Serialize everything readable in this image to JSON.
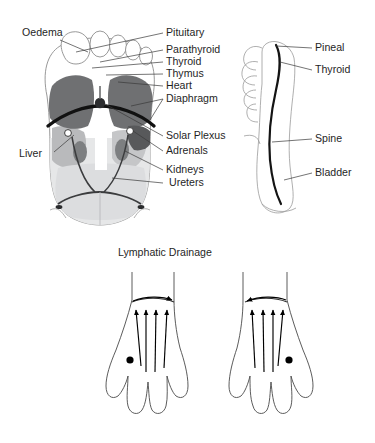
{
  "figure": {
    "title_lymphatic": "Lymphatic Drainage",
    "plantar_view": {
      "name": "plantar-foot-diagram",
      "labels_left": [
        {
          "id": "oedema",
          "text": "Oedema",
          "x": 22,
          "y": 36
        },
        {
          "id": "liver",
          "text": "Liver",
          "x": 19,
          "y": 157
        }
      ],
      "labels_right": [
        {
          "id": "pituitary",
          "text": "Pituitary",
          "x": 166,
          "y": 36
        },
        {
          "id": "parathyroid",
          "text": "Parathyroid",
          "x": 166,
          "y": 53
        },
        {
          "id": "thyroid",
          "text": "Thyroid",
          "x": 166,
          "y": 65
        },
        {
          "id": "thymus",
          "text": "Thymus",
          "x": 166,
          "y": 77
        },
        {
          "id": "heart",
          "text": "Heart",
          "x": 166,
          "y": 89
        },
        {
          "id": "diaphragm",
          "text": "Diaphragm",
          "x": 166,
          "y": 102
        },
        {
          "id": "solar-plexus",
          "text": "Solar Plexus",
          "x": 166,
          "y": 139
        },
        {
          "id": "adrenals",
          "text": "Adrenals",
          "x": 166,
          "y": 154
        },
        {
          "id": "kidneys",
          "text": "Kidneys",
          "x": 166,
          "y": 173
        },
        {
          "id": "ureters",
          "text": "Ureters",
          "x": 169,
          "y": 186
        }
      ]
    },
    "medial_view": {
      "name": "medial-foot-diagram",
      "labels": [
        {
          "id": "pineal",
          "text": "Pineal",
          "x": 315,
          "y": 51
        },
        {
          "id": "thyroid-medial",
          "text": "Thyroid",
          "x": 315,
          "y": 73
        },
        {
          "id": "spine",
          "text": "Spine",
          "x": 315,
          "y": 142
        },
        {
          "id": "bladder",
          "text": "Bladder",
          "x": 315,
          "y": 176
        }
      ]
    },
    "lymphatic_view": {
      "name": "lymphatic-drainage-diagram",
      "title_x": 118,
      "title_y": 256,
      "feet": [
        {
          "id": "left-foot",
          "side": "left"
        },
        {
          "id": "right-foot",
          "side": "right"
        }
      ],
      "arrow_count_per_foot": 4
    },
    "colors": {
      "lung_dark": "#6f7072",
      "organ_mid": "#a9abad",
      "organ_light": "#cdcfd0",
      "organ_faint": "#e2e3e4",
      "diaphragm_line": "#111111",
      "outline": "#8d8d8d",
      "text": "#1f1f1f",
      "background": "#ffffff"
    }
  }
}
